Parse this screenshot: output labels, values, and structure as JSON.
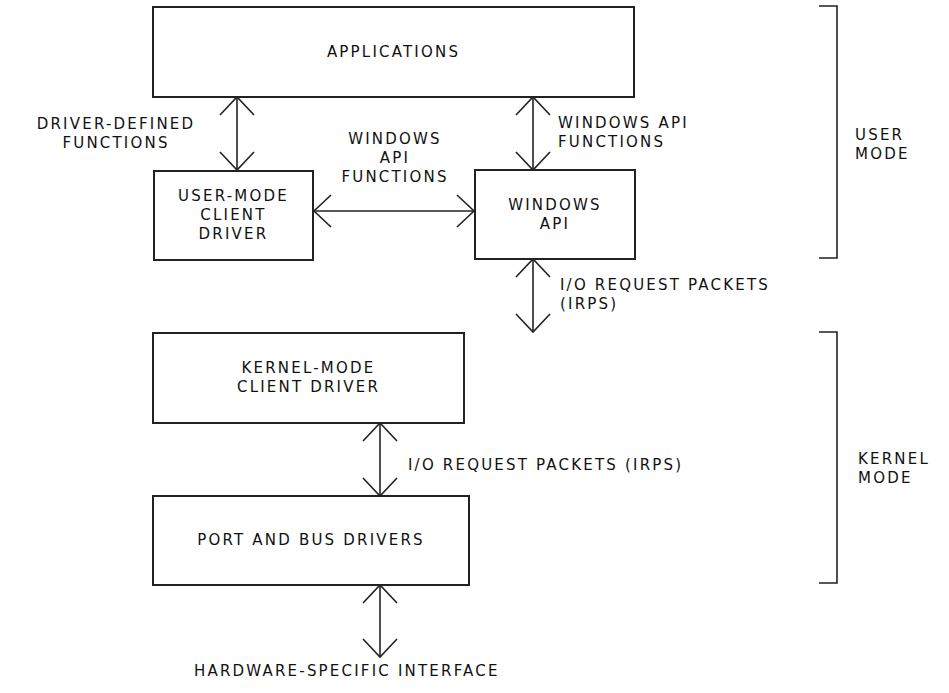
{
  "diagram": {
    "boxes": {
      "applications": "APPLICATIONS",
      "user_mode_client_driver": "USER-MODE\nCLIENT\nDRIVER",
      "windows_api": "WINDOWS\nAPI",
      "kernel_mode_client_driver": "KERNEL-MODE\nCLIENT DRIVER",
      "port_and_bus_drivers": "PORT AND BUS DRIVERS"
    },
    "edge_labels": {
      "driver_defined_functions": "DRIVER-DEFINED\nFUNCTIONS",
      "windows_api_functions_middle": "WINDOWS\nAPI\nFUNCTIONS",
      "windows_api_functions_right": "WINDOWS API\nFUNCTIONS",
      "irps_upper": "I/O REQUEST PACKETS\n(IRPS)",
      "irps_lower": "I/O REQUEST PACKETS (IRPS)",
      "hardware_interface": "HARDWARE-SPECIFIC INTERFACE"
    },
    "modes": {
      "user": "USER\nMODE",
      "kernel": "KERNEL\nMODE"
    }
  }
}
